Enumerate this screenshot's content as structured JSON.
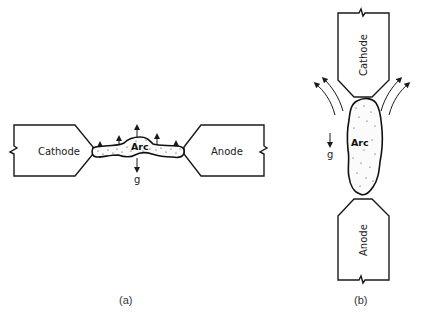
{
  "panel_a": {
    "caption": "(a)",
    "left_electrode": "Cathode",
    "right_electrode": "Anode",
    "arc_label": "Arc",
    "gravity_label": "g",
    "orientation": "horizontal",
    "buoyancy_arrows": 5
  },
  "panel_b": {
    "caption": "(b)",
    "top_electrode": "Cathode",
    "bottom_electrode": "Anode",
    "arc_label": "Arc",
    "gravity_label": "g",
    "orientation": "vertical",
    "flow_arrows_per_side": 2
  },
  "colors": {
    "line": "#1a1a1a",
    "background": "#ffffff"
  }
}
